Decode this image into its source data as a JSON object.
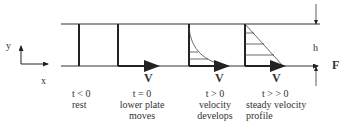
{
  "axes": {
    "x": "x",
    "y": "y"
  },
  "gap_label": "h",
  "force_label": "F",
  "stages": [
    {
      "time": "t < 0",
      "desc1": "rest",
      "desc2": "",
      "velocity": ""
    },
    {
      "time": "t = 0",
      "desc1": "lower plate",
      "desc2": "moves",
      "velocity": "V"
    },
    {
      "time": "t > 0",
      "desc1": "velocity",
      "desc2": "develops",
      "velocity": "V"
    },
    {
      "time": "t > > 0",
      "desc1": "steady velocity",
      "desc2": "profile",
      "velocity": "V"
    }
  ]
}
